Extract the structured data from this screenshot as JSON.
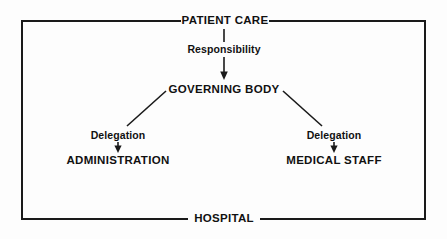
{
  "diagram": {
    "type": "hierarchy-flow",
    "background_color": "#fdfdfd",
    "line_color": "#1a1a1a",
    "text_color": "#111111",
    "boundary": {
      "top_label": "PATIENT CARE",
      "bottom_label": "HOSPITAL"
    },
    "nodes": {
      "patient_care": "PATIENT CARE",
      "responsibility": "Responsibility",
      "governing_body": "GOVERNING BODY",
      "delegation_left": "Delegation",
      "administration": "ADMINISTRATION",
      "delegation_right": "Delegation",
      "medical_staff": "MEDICAL STAFF",
      "hospital": "HOSPITAL"
    },
    "edges": [
      {
        "from": "PATIENT CARE",
        "to": "Responsibility",
        "style": "plain-line",
        "direction": "down"
      },
      {
        "from": "Responsibility",
        "to": "GOVERNING BODY",
        "style": "arrow",
        "direction": "down"
      },
      {
        "from": "GOVERNING BODY",
        "to": "Delegation",
        "style": "diagonal-line",
        "direction": "down-left"
      },
      {
        "from": "GOVERNING BODY",
        "to": "Delegation",
        "style": "diagonal-line",
        "direction": "down-right"
      },
      {
        "from": "Delegation",
        "to": "ADMINISTRATION",
        "style": "arrow",
        "direction": "down"
      },
      {
        "from": "Delegation",
        "to": "MEDICAL STAFF",
        "style": "arrow",
        "direction": "down"
      }
    ]
  }
}
